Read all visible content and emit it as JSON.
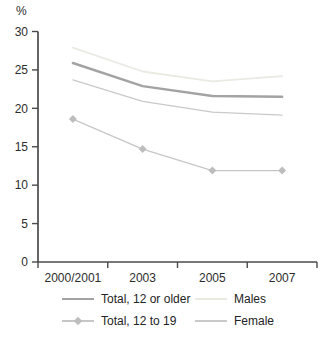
{
  "unit_label": "%",
  "colors": {
    "axis": "#4a4a4a",
    "tick_text": "#2d2d2d",
    "background": "#ffffff"
  },
  "chart_data": {
    "type": "line",
    "title": "",
    "xlabel": "",
    "ylabel": "%",
    "categories": [
      "2000/2001",
      "2003",
      "2005",
      "2007"
    ],
    "series": [
      {
        "name": "Total, 12 or older",
        "values": [
          25.9,
          22.9,
          21.6,
          21.5
        ],
        "color": "#a3a3a3",
        "width": 2.4,
        "marker": "none"
      },
      {
        "name": "Males",
        "values": [
          27.9,
          24.8,
          23.5,
          24.2
        ],
        "color": "#eaeae3",
        "width": 1.8,
        "marker": "none"
      },
      {
        "name": "Total, 12 to 19",
        "values": [
          18.6,
          14.7,
          11.9,
          11.9
        ],
        "color": "#c6c6c6",
        "width": 1.2,
        "marker": "diamond",
        "marker_color": "#bdbdbd"
      },
      {
        "name": "Female",
        "values": [
          23.7,
          20.9,
          19.5,
          19.1
        ],
        "color": "#c9c9c9",
        "width": 1.2,
        "marker": "none"
      }
    ],
    "y_ticks": [
      0,
      5,
      10,
      15,
      20,
      25,
      30
    ],
    "ylim": [
      0,
      30
    ],
    "grid": false,
    "legend_position": "bottom"
  }
}
